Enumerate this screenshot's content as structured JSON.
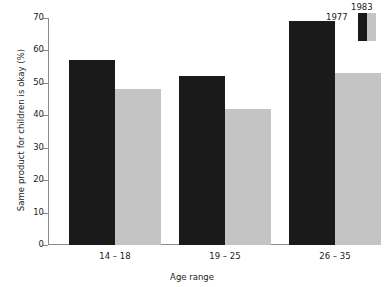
{
  "chart_data": {
    "type": "bar",
    "title": "",
    "subtitle": "",
    "xlabel": "Age range",
    "ylabel": "Same product for children is okay (%)",
    "categories": [
      "14 – 18",
      "19 – 25",
      "26 – 35"
    ],
    "series": [
      {
        "name": "1977",
        "color": "#1a1a1a",
        "values": [
          57,
          52,
          69
        ]
      },
      {
        "name": "1983",
        "color": "#c4c4c4",
        "values": [
          48,
          42,
          53
        ]
      }
    ],
    "ylim": [
      0,
      70
    ],
    "ytick_step": 10,
    "yticks": [
      0,
      10,
      20,
      30,
      40,
      50,
      60,
      70
    ],
    "ytick_labels": [
      "0",
      "10",
      "20",
      "30",
      "40",
      "50",
      "60",
      "70"
    ],
    "grid": false,
    "legend_position": "top-right",
    "legend_entries": [
      {
        "label": "1983",
        "color": "#c4c4c4"
      },
      {
        "label": "1977",
        "color": "#1a1a1a"
      }
    ]
  },
  "colors": {
    "series_1977": "#1a1a1a",
    "series_1983": "#c4c4c4",
    "axis": "#8a8a8a",
    "text": "#1a1a1a",
    "background": "#ffffff"
  }
}
